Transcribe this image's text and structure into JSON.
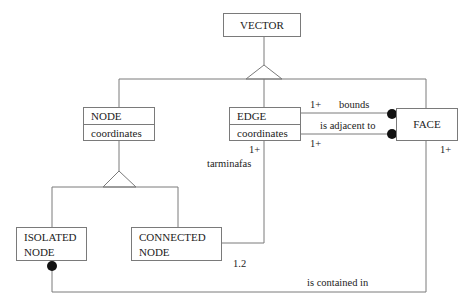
{
  "diagram": {
    "type": "class-diagram",
    "classes": {
      "vector": {
        "name": "VECTOR"
      },
      "node": {
        "name": "NODE",
        "attribute": "coordinates"
      },
      "edge": {
        "name": "EDGE",
        "attribute": "coordinates"
      },
      "face": {
        "name": "FACE"
      },
      "isolated_node": {
        "line1": "ISOLATED",
        "line2": "NODE"
      },
      "connected_node": {
        "line1": "CONNECTED",
        "line2": "NODE"
      }
    },
    "associations": {
      "bounds": {
        "label": "bounds",
        "multiplicity": "1+"
      },
      "adjacent": {
        "label": "is adjacent to",
        "multiplicity": "1+"
      },
      "terminates": {
        "label": "tarminafas",
        "multiplicity_edge": "1+",
        "multiplicity_node": "1.2"
      },
      "contained": {
        "label": "is contained in",
        "multiplicity": "1+"
      }
    }
  }
}
